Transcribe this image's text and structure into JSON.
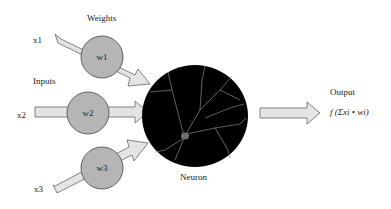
{
  "diagram": {
    "title_weights": "Weights",
    "title_inputs": "Inputs",
    "inputs": [
      {
        "label": "x1",
        "weight": "w1"
      },
      {
        "label": "x2",
        "weight": "w2"
      },
      {
        "label": "x3",
        "weight": "w3"
      }
    ],
    "neuron_label": "Neuron",
    "output_label": "Output",
    "output_formula": "f (Σxi • wi)"
  },
  "colors": {
    "arrow_fill": "#e4e4e4",
    "arrow_stroke": "#666666",
    "weight_fill": "#b5b5b5",
    "neuron_fill": "#000000",
    "dendrite": "#8a8a8a"
  }
}
